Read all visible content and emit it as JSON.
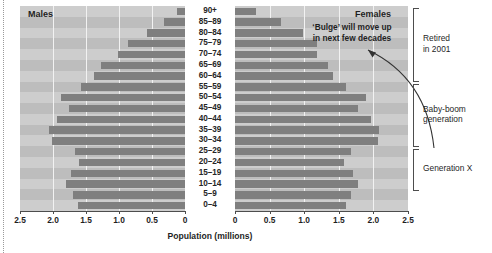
{
  "chart_data": {
    "type": "bar",
    "subtype": "population-pyramid",
    "title": "",
    "xlabel": "Population (millions)",
    "ylabel": "",
    "categories": [
      "90+",
      "85–89",
      "80–84",
      "75–79",
      "70–74",
      "65–69",
      "60–64",
      "55–59",
      "50–54",
      "45–49",
      "40–44",
      "35–39",
      "30–34",
      "25–29",
      "20–24",
      "15–19",
      "10–14",
      "5–9",
      "0–4"
    ],
    "series": [
      {
        "name": "Males",
        "side": "left",
        "values": [
          0.12,
          0.32,
          0.58,
          0.86,
          1.02,
          1.28,
          1.38,
          1.58,
          1.88,
          1.76,
          1.94,
          2.06,
          2.02,
          1.66,
          1.6,
          1.72,
          1.8,
          1.7,
          1.62
        ]
      },
      {
        "name": "Females",
        "side": "right",
        "values": [
          0.3,
          0.66,
          0.98,
          1.18,
          1.18,
          1.34,
          1.42,
          1.6,
          1.9,
          1.78,
          1.96,
          2.08,
          2.06,
          1.68,
          1.58,
          1.7,
          1.78,
          1.68,
          1.6
        ]
      }
    ],
    "xlim_left": [
      2.5,
      0
    ],
    "xlim_right": [
      0,
      2.5
    ],
    "xticks_left": [
      "2.5",
      "2.0",
      "1.5",
      "1.0",
      "0.5",
      "0"
    ],
    "xticks_right": [
      "0",
      "0.5",
      "1.0",
      "1.5",
      "2.0",
      "2.5"
    ],
    "grid": true,
    "legend": "none",
    "annotations": [
      {
        "text": "‘Bulge’ will move up in next few decades",
        "target_category": "35–39"
      }
    ],
    "colors": {
      "bar": "#7f7f7f",
      "panel_band_light": "#cdcdcd",
      "panel_band_dark": "#bdbdbd",
      "gridline": "#f2f2f2",
      "axis": "#4d4d4d",
      "text": "#1f1f1f"
    }
  },
  "panels": {
    "males_title": "Males",
    "females_title": "Females"
  },
  "annotation": {
    "line1": "‘Bulge’ will move up",
    "line2": "in next few decades"
  },
  "axis": {
    "x_title": "Population (millions)",
    "left_ticks": [
      "2.5",
      "2.0",
      "1.5",
      "1.0",
      "0.5",
      "0"
    ],
    "right_ticks": [
      "0",
      "0.5",
      "1.0",
      "1.5",
      "2.0",
      "2.5"
    ]
  },
  "age_groups": [
    "90+",
    "85–89",
    "80–84",
    "75–79",
    "70–74",
    "65–69",
    "60–64",
    "55–59",
    "50–54",
    "45–49",
    "40–44",
    "35–39",
    "30–34",
    "25–29",
    "20–24",
    "15–19",
    "10–14",
    "5–9",
    "0–4"
  ],
  "brackets": [
    {
      "label_line1": "Retired",
      "label_line2": "in 2001"
    },
    {
      "label_line1": "Baby-boom",
      "label_line2": "generation"
    },
    {
      "label_line1": "Generation X",
      "label_line2": ""
    }
  ]
}
